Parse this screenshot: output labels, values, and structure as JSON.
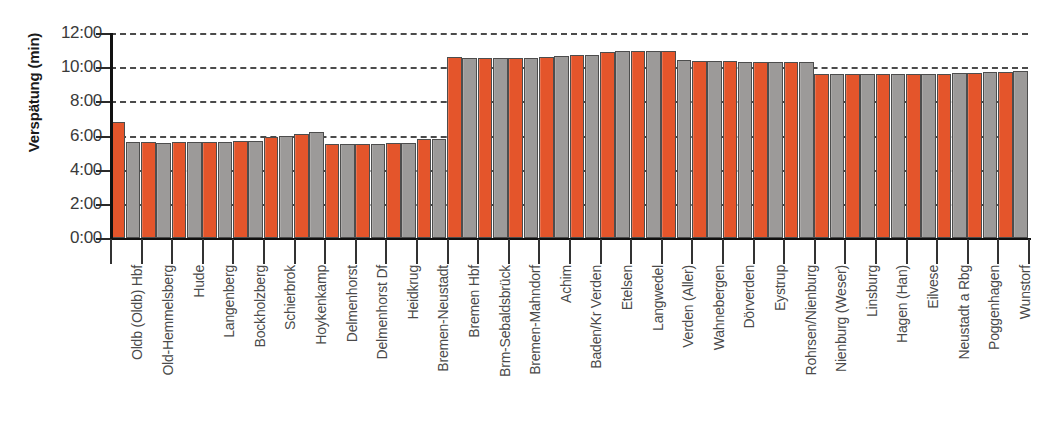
{
  "chart_data": {
    "type": "bar",
    "title": "",
    "subtitle": "",
    "xlabel": "",
    "ylabel": "Verspätung (min)",
    "ylim": [
      0,
      12
    ],
    "ytick_labels": [
      "0:00",
      "2:00",
      "4:00",
      "6:00",
      "8:00",
      "10:00",
      "12:00"
    ],
    "ytick_values": [
      0,
      2,
      4,
      6,
      8,
      10,
      12
    ],
    "grid": true,
    "legend_position": "none",
    "units": "minutes (mm:ss as m:ss on axis)",
    "categories": [
      "Oldb (Oldb) Hbf",
      "Old-Hemmelsberg",
      "Hude",
      "Langenberg",
      "Bockholzberg",
      "Schierbrok",
      "Hoykenkamp",
      "Delmenhorst",
      "Delmenhorst Df",
      "Heidkrug",
      "Bremen-Neustadt",
      "Bremen Hbf",
      "Brm-Sebaldsbrück",
      "Bremen-Mahndorf",
      "Achim",
      "Baden/Kr Verden",
      "Etelsen",
      "Langwedel",
      "Verden (Aller)",
      "Wahnebergen",
      "Dörverden",
      "Eystrup",
      "Rohrsen/Nienburg",
      "Nienburg (Weser)",
      "Linsburg",
      "Hagen (Han)",
      "Eilvese",
      "Neustadt a Rbg",
      "Poggenhagen",
      "Wunstorf"
    ],
    "series": [
      {
        "name": "series-orange",
        "color": "#e4552b",
        "values": [
          6.8,
          5.62,
          5.62,
          5.62,
          5.65,
          5.9,
          6.1,
          5.52,
          5.52,
          5.55,
          5.78,
          10.6,
          10.52,
          10.52,
          10.62,
          10.7,
          10.9,
          10.92,
          10.95,
          10.35,
          10.35,
          10.32,
          10.32,
          9.62,
          9.58,
          9.62,
          9.62,
          9.62,
          9.68,
          9.72
        ]
      },
      {
        "name": "series-gray",
        "color": "#9c9a99",
        "values": [
          5.62,
          5.58,
          5.6,
          5.62,
          5.68,
          5.95,
          6.2,
          5.48,
          5.52,
          5.55,
          5.78,
          10.52,
          10.55,
          10.55,
          10.65,
          10.72,
          10.92,
          10.92,
          10.4,
          10.35,
          10.32,
          10.32,
          10.3,
          9.6,
          9.58,
          9.62,
          9.62,
          9.65,
          9.7,
          9.78
        ]
      }
    ]
  },
  "axis": {
    "y_title": "Verspätung (min)"
  }
}
